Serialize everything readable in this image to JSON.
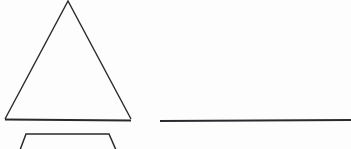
{
  "canvas": {
    "width": 351,
    "height": 149,
    "background_color": "#fdfdfd",
    "title": "Geometric line drawing"
  },
  "style": {
    "stroke_color": "#2a2a2e",
    "stroke_width_thin": 1.4,
    "stroke_width_thick": 1.9,
    "fill": "none"
  },
  "shapes": [
    {
      "id": "triangle",
      "label": "Triangle",
      "kind": "polyline",
      "clipped_at_top": true,
      "points": "5,119 68,1 131,119",
      "stroke_width": 1.4
    },
    {
      "id": "triangle-base",
      "label": "Triangle base",
      "kind": "line",
      "x1": 5,
      "y1": 119.5,
      "x2": 131,
      "y2": 120.5,
      "stroke_width": 1.9
    },
    {
      "id": "horizontal-line",
      "label": "Horizontal line segment",
      "kind": "line",
      "x1": 160,
      "y1": 121,
      "x2": 351,
      "y2": 120,
      "stroke_width": 1.9
    },
    {
      "id": "trapezoid",
      "label": "Trapezoid (cropped at bottom edge)",
      "kind": "polyline",
      "clipped_at_bottom": true,
      "points": "20,150 26,134 109,134 116,150",
      "stroke_width": 1.5
    }
  ],
  "annotations": {
    "text_present": false,
    "labels": []
  }
}
